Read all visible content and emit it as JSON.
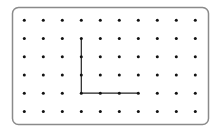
{
  "diagram": {
    "type": "dot-grid",
    "columns": 10,
    "rows": 6,
    "border": {
      "x": 12.5,
      "y": 7.5,
      "width": 196,
      "height": 117,
      "radius": 6,
      "color": "#8a8a8a"
    },
    "grid_origin": {
      "x": 24.3,
      "y": 20.2
    },
    "spacing": {
      "x": 19.0,
      "y": 18.25
    },
    "dot_color": "#111111",
    "dot_radius": 1.5,
    "line_color": "#222222",
    "path": [
      {
        "col": 3,
        "row": 1
      },
      {
        "col": 3,
        "row": 4
      },
      {
        "col": 6,
        "row": 4
      }
    ]
  }
}
